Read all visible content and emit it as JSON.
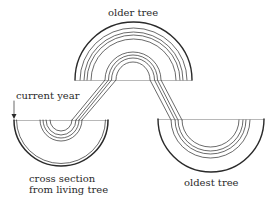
{
  "diagram": {
    "type": "cross-dating tree-ring diagram",
    "labels": {
      "older_tree": "older tree",
      "current_year": "current year",
      "living_tree_line1": "cross section",
      "living_tree_line2": "from living tree",
      "oldest_tree": "oldest tree"
    },
    "sections": [
      {
        "id": "living-tree",
        "label": "cross section from living tree",
        "position": "bottom-left"
      },
      {
        "id": "older-tree",
        "label": "older tree",
        "position": "top-center"
      },
      {
        "id": "oldest-tree",
        "label": "oldest tree",
        "position": "bottom-right"
      }
    ],
    "colors": {
      "line": "#2a2a2a",
      "background": "#ffffff"
    }
  }
}
